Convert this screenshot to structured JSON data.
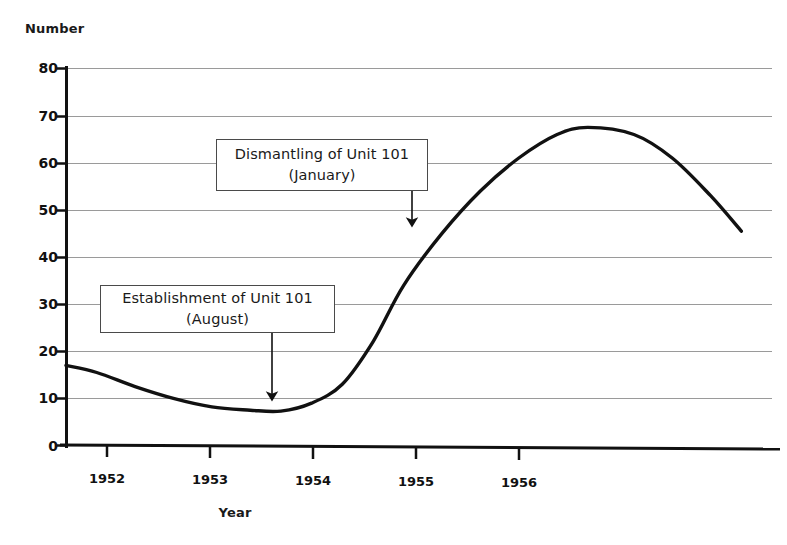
{
  "chart_data": {
    "type": "line",
    "title": "",
    "xlabel": "Year",
    "ylabel": "Number",
    "ylim": [
      0,
      80
    ],
    "xlim": [
      1951.8,
      1956.4
    ],
    "yticks": [
      0,
      10,
      20,
      30,
      40,
      50,
      60,
      70,
      80
    ],
    "xticks": [
      "1952",
      "1953",
      "1954",
      "1955",
      "1956"
    ],
    "grid": true,
    "legend": "none",
    "series": [
      {
        "name": "Number",
        "x": [
          1951.8,
          1952.0,
          1952.25,
          1952.5,
          1952.75,
          1953.0,
          1953.2,
          1953.4,
          1953.6,
          1953.8,
          1954.0,
          1954.25,
          1954.5,
          1954.75,
          1955.0,
          1955.2,
          1955.5,
          1955.75,
          1956.0,
          1956.2
        ],
        "values": [
          17,
          15.5,
          12.5,
          10,
          8.2,
          7.5,
          7.3,
          9,
          13,
          22,
          34,
          45,
          54,
          61,
          66,
          67.5,
          66,
          61,
          53,
          45.5
        ]
      }
    ],
    "annotations": [
      {
        "id": "dismantling",
        "line1": "Dismantling of Unit 101",
        "line2": "(January)",
        "points_to_year": "1954",
        "points_to_value": 45
      },
      {
        "id": "establishment",
        "line1": "Establishment of Unit 101",
        "line2": "(August)",
        "points_to_year": "1953",
        "points_to_value": 7.5
      }
    ],
    "colors": {
      "line": "#111111",
      "grid": "#9a9a9a",
      "axis": "#111111",
      "background": "#ffffff",
      "annotation_border": "#4a4a4a"
    }
  },
  "axes": {
    "y_title": "Number",
    "x_title": "Year",
    "y_labels": [
      "80",
      "70",
      "60",
      "50",
      "40",
      "30",
      "20",
      "10",
      "0"
    ],
    "x_labels": [
      "1952",
      "1953",
      "1954",
      "1955",
      "1956"
    ]
  },
  "annotations": {
    "top": {
      "line1": "Dismantling of Unit 101",
      "line2": "(January)"
    },
    "bottom": {
      "line1": "Establishment of Unit 101",
      "line2": "(August)"
    }
  }
}
